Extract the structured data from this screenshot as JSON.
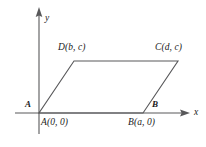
{
  "figure": {
    "type": "coordinate-geometry-diagram",
    "colors": {
      "background": "#ffffff",
      "axis": "#58585a",
      "shape": "#58585a",
      "text": "#1a1a1a"
    },
    "axes": {
      "x_label": "x",
      "y_label": "y",
      "x_axis": {
        "x1": 15,
        "y1": 113,
        "x2": 183,
        "y2": 113
      },
      "y_axis": {
        "x1": 39,
        "y1": 13,
        "x2": 39,
        "y2": 134
      },
      "x_label_pos": {
        "x": 194,
        "y": 108
      },
      "y_label_pos": {
        "x": 45,
        "y": 14
      }
    },
    "polygon": {
      "name": "parallelogram-ABCD",
      "points": "39,113 143,113 178,61 74,61"
    },
    "vertices": [
      {
        "name": "A",
        "letter": "A",
        "coords": "A(0, 0)",
        "px": 39,
        "py": 113,
        "letter_pos": {
          "x": 25,
          "y": 100
        },
        "coord_pos": {
          "x": 41,
          "y": 118
        }
      },
      {
        "name": "B",
        "letter": "B",
        "coords": "B(a, 0)",
        "px": 143,
        "py": 113,
        "letter_pos": {
          "x": 152,
          "y": 100
        },
        "coord_pos": {
          "x": 128,
          "y": 118
        }
      },
      {
        "name": "C",
        "letter": "C",
        "coords": "C(d, c)",
        "px": 178,
        "py": 61,
        "letter_pos": {
          "x": 0,
          "y": 0
        },
        "coord_pos": {
          "x": 155,
          "y": 43
        }
      },
      {
        "name": "D",
        "letter": "D",
        "coords": "D(b, c)",
        "px": 74,
        "py": 61,
        "letter_pos": {
          "x": 0,
          "y": 0
        },
        "coord_pos": {
          "x": 58,
          "y": 43
        }
      }
    ]
  }
}
